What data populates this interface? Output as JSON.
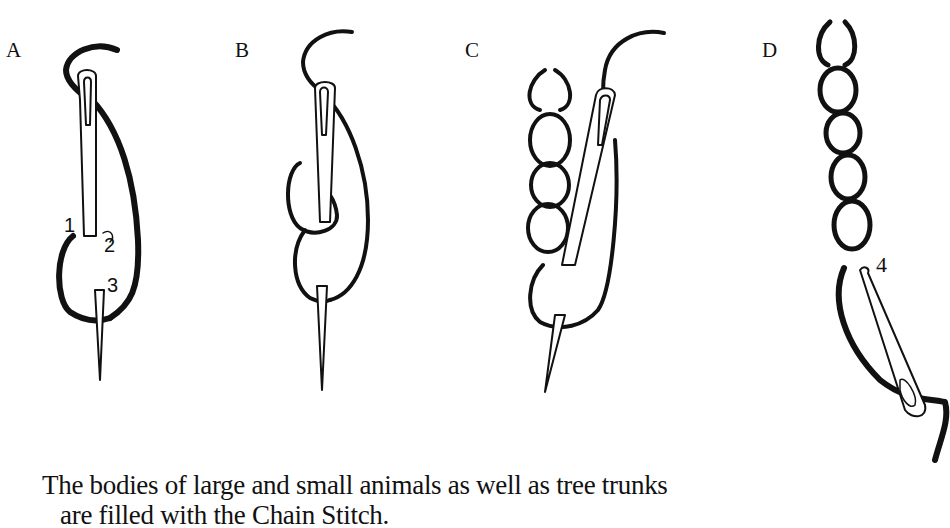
{
  "figure": {
    "panels": [
      {
        "label": "A",
        "step_numbers": [
          "1",
          "2",
          "3"
        ]
      },
      {
        "label": "B",
        "step_numbers": []
      },
      {
        "label": "C",
        "step_numbers": []
      },
      {
        "label": "D",
        "step_numbers": [
          "4"
        ]
      }
    ]
  },
  "caption": {
    "line1": "The bodies of large and small animals as well as tree trunks",
    "line2": "are filled with the Chain Stitch."
  }
}
